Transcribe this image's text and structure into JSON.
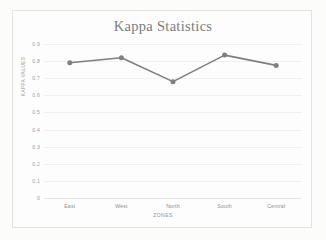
{
  "chart_data": {
    "type": "line",
    "title": "Kappa Statistics",
    "xlabel": "ZONES",
    "ylabel": "KAPPA VALUES",
    "categories": [
      "East",
      "West",
      "North",
      "South",
      "Central"
    ],
    "values": [
      0.79,
      0.82,
      0.68,
      0.835,
      0.775
    ],
    "ylim": [
      0,
      0.9
    ],
    "ytick_labels": [
      "0.9",
      "0.8",
      "0.7",
      "0.6",
      "0.5",
      "0.4",
      "0.3",
      "0.2",
      "0.1",
      "0"
    ],
    "ytick_values": [
      0.9,
      0.8,
      0.7,
      0.6,
      0.5,
      0.4,
      0.3,
      0.2,
      0.1,
      0
    ],
    "grid": true,
    "legend": false,
    "series_color": "#7f7f7f",
    "marker": "circle"
  },
  "style": {
    "title_color": "#7c7c7c",
    "tick_color": "#9b9b9b",
    "grid_color": "#f0f0ef",
    "frame_color": "#e2e2e2",
    "background": "#fdfdfd"
  }
}
